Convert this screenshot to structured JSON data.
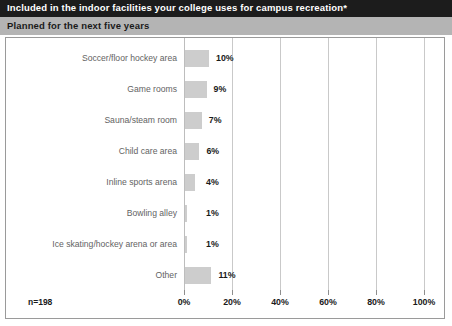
{
  "header": {
    "title": "Included in the indoor facilities your college uses for campus recreation*",
    "subtitle": "Planned for the next five years"
  },
  "footer": {
    "sample_size": "n=198"
  },
  "chart_data": {
    "type": "bar",
    "orientation": "horizontal",
    "title": "Included in the indoor facilities your college uses for campus recreation*",
    "subtitle": "Planned for the next five years",
    "xlabel": "",
    "ylabel": "",
    "xlim": [
      0,
      100
    ],
    "grid": true,
    "legend": false,
    "bar_color": "#cdcdcd",
    "categories": [
      "Soccer/floor hockey area",
      "Game rooms",
      "Sauna/steam room",
      "Child care area",
      "Inline sports arena",
      "Bowling alley",
      "Ice skating/hockey arena or area",
      "Other"
    ],
    "values": [
      10,
      9,
      7,
      6,
      4,
      1,
      1,
      11
    ],
    "value_labels": [
      "10%",
      "9%",
      "7%",
      "6%",
      "4%",
      "1%",
      "1%",
      "11%"
    ],
    "xticks": [
      0,
      20,
      40,
      60,
      80,
      100
    ],
    "xtick_labels": [
      "0%",
      "20%",
      "40%",
      "60%",
      "80%",
      "100%"
    ],
    "annotation": "n=198"
  }
}
